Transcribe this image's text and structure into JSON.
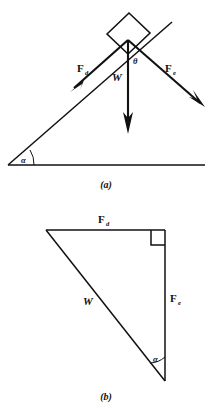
{
  "figure": {
    "panels": [
      {
        "id": "a",
        "caption": "(a)",
        "description": "block on inclined plane with force vectors",
        "labels": {
          "force_down_incline": "F",
          "force_down_incline_sub": "d",
          "force_normal_side": "F",
          "force_normal_side_sub": "e",
          "weight": "W",
          "angle_theta": "θ",
          "angle_alpha": "α"
        }
      },
      {
        "id": "b",
        "caption": "(b)",
        "description": "force triangle with right angle",
        "labels": {
          "force_top": "F",
          "force_top_sub": "d",
          "force_right": "F",
          "force_right_sub": "e",
          "weight": "W",
          "angle_alpha": "α"
        }
      }
    ],
    "colors": {
      "ink": "#111111",
      "background": "#ffffff"
    }
  }
}
